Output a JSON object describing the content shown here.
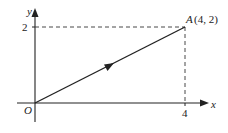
{
  "diagram": {
    "axes": {
      "x_label": "x",
      "y_label": "y",
      "origin_label": "O"
    },
    "ticks": {
      "x_tick_label": "4",
      "y_tick_label": "2"
    },
    "point": {
      "name": "A",
      "coords_label": "(4, 2)",
      "x": 4,
      "y": 2
    },
    "segment": {
      "from": "O",
      "to": "A",
      "direction_arrow": "towards A"
    },
    "colors": {
      "line": "#222222",
      "background": "#ffffff"
    }
  }
}
